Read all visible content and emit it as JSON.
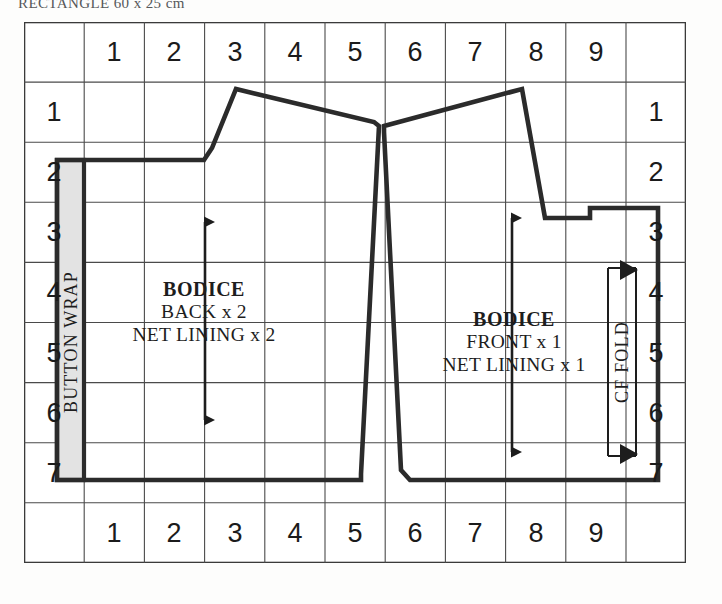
{
  "caption": "RECTANGLE 60 x 25 cm",
  "grid": {
    "columns": 11,
    "rows": 9,
    "cell_width": 60.2,
    "cell_height": 60.1,
    "line_color": "#3a3a3a",
    "background": "#ffffff"
  },
  "rulers": {
    "top": [
      "1",
      "2",
      "3",
      "4",
      "5",
      "6",
      "7",
      "8",
      "9"
    ],
    "bottom": [
      "1",
      "2",
      "3",
      "4",
      "5",
      "6",
      "7",
      "8",
      "9"
    ],
    "left": [
      "1",
      "2",
      "3",
      "4",
      "5",
      "6",
      "7"
    ],
    "right": [
      "1",
      "2",
      "3",
      "4",
      "5",
      "6",
      "7"
    ]
  },
  "pieces": {
    "button_wrap": {
      "label": "BUTTON WRAP",
      "fill": "#e3e3e3",
      "outline_color": "#2a2a2a"
    },
    "bodice_back": {
      "title": "BODICE",
      "line2": "BACK x 2",
      "line3": "NET LINING x 2",
      "grainline": "grainline-arrow-back"
    },
    "bodice_front": {
      "title": "BODICE",
      "line2": "FRONT x 1",
      "line3": "NET LINING x 1",
      "grainline": "grainline-arrow-front"
    },
    "cf_fold": {
      "label": "CF FOLD"
    }
  },
  "colors": {
    "ink": "#1d1d1d",
    "piece_outline": "#2b2b2b",
    "grid_line": "#4a4a4a",
    "caption_text": "#56585a"
  }
}
